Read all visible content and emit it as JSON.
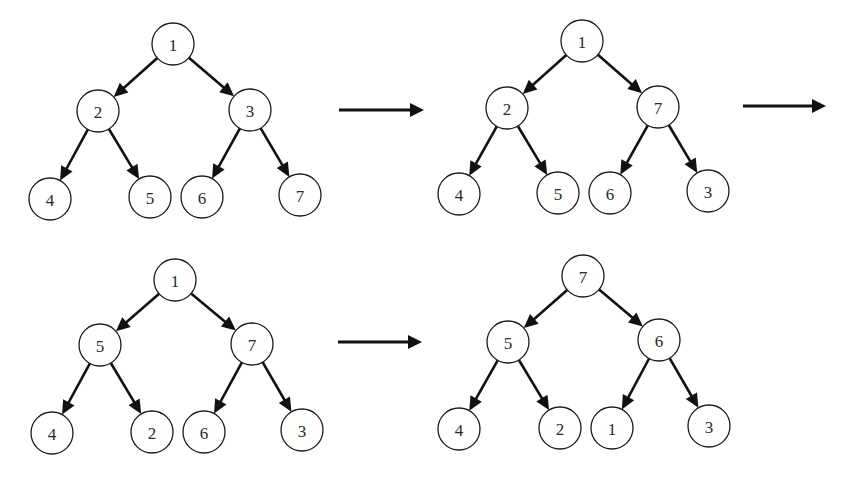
{
  "diagram": {
    "type": "heapify-steps",
    "node_radius": 21,
    "colors": {
      "background": "#ffffff",
      "stroke": "#111111",
      "node_fill": "#ffffff",
      "label": "#2a2a2a"
    },
    "trees": [
      {
        "id": "tree-1",
        "step": 1,
        "nodes": [
          {
            "id": "a",
            "label": "1",
            "x": 173,
            "y": 44
          },
          {
            "id": "b",
            "label": "2",
            "x": 98,
            "y": 111
          },
          {
            "id": "c",
            "label": "3",
            "x": 250,
            "y": 110
          },
          {
            "id": "d",
            "label": "4",
            "x": 50,
            "y": 199
          },
          {
            "id": "e",
            "label": "5",
            "x": 150,
            "y": 197
          },
          {
            "id": "f",
            "label": "6",
            "x": 202,
            "y": 197
          },
          {
            "id": "g",
            "label": "7",
            "x": 300,
            "y": 195
          }
        ],
        "edges": [
          [
            "a",
            "b"
          ],
          [
            "a",
            "c"
          ],
          [
            "b",
            "d"
          ],
          [
            "b",
            "e"
          ],
          [
            "c",
            "f"
          ],
          [
            "c",
            "g"
          ]
        ]
      },
      {
        "id": "tree-2",
        "step": 2,
        "nodes": [
          {
            "id": "a",
            "label": "1",
            "x": 582,
            "y": 41
          },
          {
            "id": "b",
            "label": "2",
            "x": 507,
            "y": 108
          },
          {
            "id": "c",
            "label": "7",
            "x": 658,
            "y": 107
          },
          {
            "id": "d",
            "label": "4",
            "x": 459,
            "y": 194
          },
          {
            "id": "e",
            "label": "5",
            "x": 558,
            "y": 193
          },
          {
            "id": "f",
            "label": "6",
            "x": 610,
            "y": 193
          },
          {
            "id": "g",
            "label": "3",
            "x": 708,
            "y": 191
          }
        ],
        "edges": [
          [
            "a",
            "b"
          ],
          [
            "a",
            "c"
          ],
          [
            "b",
            "d"
          ],
          [
            "b",
            "e"
          ],
          [
            "c",
            "f"
          ],
          [
            "c",
            "g"
          ]
        ]
      },
      {
        "id": "tree-3",
        "step": 3,
        "nodes": [
          {
            "id": "a",
            "label": "1",
            "x": 175,
            "y": 280
          },
          {
            "id": "b",
            "label": "5",
            "x": 100,
            "y": 345
          },
          {
            "id": "c",
            "label": "7",
            "x": 252,
            "y": 344
          },
          {
            "id": "d",
            "label": "4",
            "x": 52,
            "y": 433
          },
          {
            "id": "e",
            "label": "2",
            "x": 152,
            "y": 432
          },
          {
            "id": "f",
            "label": "6",
            "x": 204,
            "y": 432
          },
          {
            "id": "g",
            "label": "3",
            "x": 302,
            "y": 430
          }
        ],
        "edges": [
          [
            "a",
            "b"
          ],
          [
            "a",
            "c"
          ],
          [
            "b",
            "d"
          ],
          [
            "b",
            "e"
          ],
          [
            "c",
            "f"
          ],
          [
            "c",
            "g"
          ]
        ]
      },
      {
        "id": "tree-4",
        "step": 4,
        "nodes": [
          {
            "id": "a",
            "label": "7",
            "x": 583,
            "y": 276
          },
          {
            "id": "b",
            "label": "5",
            "x": 508,
            "y": 342
          },
          {
            "id": "c",
            "label": "6",
            "x": 659,
            "y": 340
          },
          {
            "id": "d",
            "label": "4",
            "x": 459,
            "y": 429
          },
          {
            "id": "e",
            "label": "2",
            "x": 560,
            "y": 428
          },
          {
            "id": "f",
            "label": "1",
            "x": 612,
            "y": 428
          },
          {
            "id": "g",
            "label": "3",
            "x": 709,
            "y": 426
          }
        ],
        "edges": [
          [
            "a",
            "b"
          ],
          [
            "a",
            "c"
          ],
          [
            "b",
            "d"
          ],
          [
            "b",
            "e"
          ],
          [
            "c",
            "f"
          ],
          [
            "c",
            "g"
          ]
        ]
      }
    ],
    "step_arrows": [
      {
        "id": "arrow-1-to-2",
        "x1": 339,
        "y1": 110,
        "x2": 424,
        "y2": 110
      },
      {
        "id": "arrow-2-to-3",
        "x1": 743,
        "y1": 106,
        "x2": 826,
        "y2": 106
      },
      {
        "id": "arrow-3-to-4",
        "x1": 338,
        "y1": 342,
        "x2": 422,
        "y2": 342
      }
    ]
  }
}
